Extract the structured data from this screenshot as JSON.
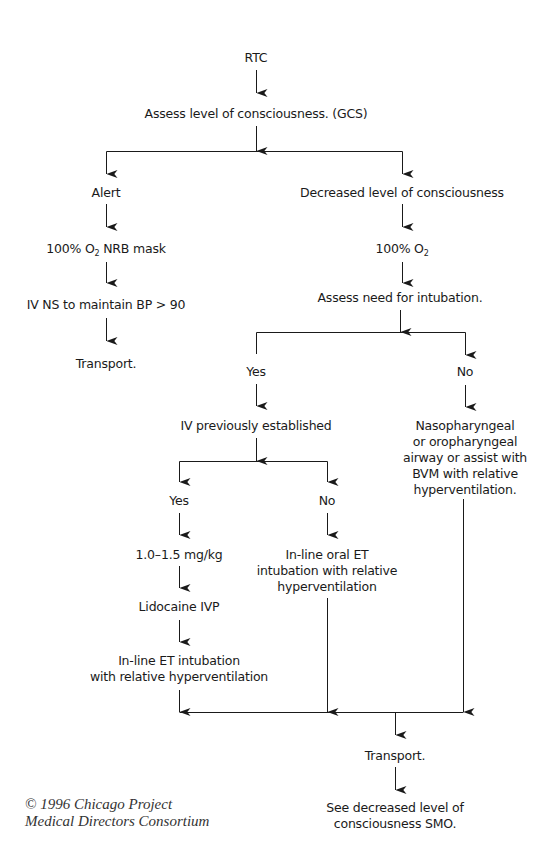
{
  "diagram": {
    "type": "flowchart",
    "colors": {
      "line": "#1a1a1a",
      "text": "#1a1a1a",
      "background": "#ffffff"
    },
    "nodes": {
      "rtc": {
        "label": "RTC"
      },
      "assess_loc": {
        "label": "Assess level of consciousness. (GCS)"
      },
      "alert": {
        "label": "Alert"
      },
      "decreased_loc": {
        "label": "Decreased level of consciousness"
      },
      "alert_o2": {
        "prefix": "100% O",
        "sub": "2",
        "suffix": " NRB mask"
      },
      "alert_iv": {
        "label": "IV NS to maintain BP > 90"
      },
      "alert_transport": {
        "label": "Transport."
      },
      "dec_o2": {
        "prefix": "100% O",
        "sub": "2"
      },
      "assess_intubation": {
        "label": "Assess need for intubation."
      },
      "intubation_yes": {
        "label": "Yes"
      },
      "intubation_no": {
        "label": "No"
      },
      "iv_established": {
        "label": "IV previously established"
      },
      "iv_yes": {
        "label": "Yes"
      },
      "iv_no": {
        "label": "No"
      },
      "dose": {
        "label": "1.0–1.5 mg/kg"
      },
      "lidocaine": {
        "label": "Lidocaine IVP"
      },
      "inline_et": {
        "lines": [
          "In-line ET intubation",
          "with relative hyperventilation"
        ]
      },
      "inline_oral_et": {
        "lines": [
          "In-line oral ET",
          "intubation with relative",
          "hyperventilation"
        ]
      },
      "airway": {
        "lines": [
          "Nasopharyngeal",
          "or oropharyngeal",
          "airway or assist with",
          "BVM with relative",
          "hyperventilation."
        ]
      },
      "final_transport": {
        "label": "Transport."
      },
      "see_smo": {
        "lines": [
          "See decreased level of",
          "consciousness SMO."
        ]
      }
    },
    "edges": [
      [
        "rtc",
        "assess_loc"
      ],
      [
        "assess_loc",
        "alert"
      ],
      [
        "assess_loc",
        "decreased_loc"
      ],
      [
        "alert",
        "alert_o2"
      ],
      [
        "alert_o2",
        "alert_iv"
      ],
      [
        "alert_iv",
        "alert_transport"
      ],
      [
        "decreased_loc",
        "dec_o2"
      ],
      [
        "dec_o2",
        "assess_intubation"
      ],
      [
        "assess_intubation",
        "intubation_yes"
      ],
      [
        "assess_intubation",
        "intubation_no"
      ],
      [
        "intubation_yes",
        "iv_established"
      ],
      [
        "intubation_no",
        "airway"
      ],
      [
        "iv_established",
        "iv_yes"
      ],
      [
        "iv_established",
        "iv_no"
      ],
      [
        "iv_yes",
        "dose"
      ],
      [
        "dose",
        "lidocaine"
      ],
      [
        "lidocaine",
        "inline_et"
      ],
      [
        "iv_no",
        "inline_oral_et"
      ],
      [
        "inline_et",
        "final_transport"
      ],
      [
        "inline_oral_et",
        "final_transport"
      ],
      [
        "airway",
        "final_transport"
      ],
      [
        "final_transport",
        "see_smo"
      ]
    ]
  },
  "credit": {
    "lines": [
      "© 1996 Chicago Project",
      "Medical Directors Consortium"
    ]
  }
}
